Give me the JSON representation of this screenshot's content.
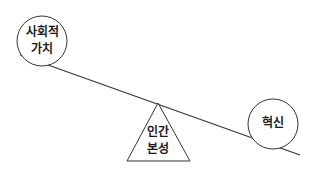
{
  "diagram": {
    "type": "seesaw-balance",
    "left_weight": {
      "line1": "사회적",
      "line2": "가치"
    },
    "right_weight": {
      "label": "혁신"
    },
    "fulcrum": {
      "line1": "인간",
      "line2": "본성"
    },
    "stroke_color": "#333333"
  }
}
